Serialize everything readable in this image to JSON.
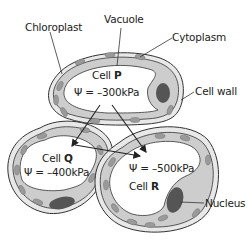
{
  "labels": {
    "chloroplast": "Chloroplast",
    "vacuole": "Vacuole",
    "cytoplasm": "Cytoplasm",
    "cell_wall": "Cell wall",
    "nucleus": "Nucleus"
  },
  "cells": [
    {
      "id": "P",
      "prefix": "Cell",
      "name": "P",
      "potential": "Ψ = –300kPa"
    },
    {
      "id": "Q",
      "prefix": "Cell",
      "name": "Q",
      "potential": "Ψ = –400kPa"
    },
    {
      "id": "R",
      "prefix": "Cell",
      "name": "R",
      "potential": "Ψ = –500kPa"
    }
  ],
  "arrows": [
    {
      "from": "P",
      "to": "Q"
    },
    {
      "from": "P",
      "to": "R"
    },
    {
      "from": "Q",
      "to": "R"
    }
  ],
  "colors": {
    "outline": "#333333",
    "wall_fill": "#e6e6e6",
    "cytoplasm_fill": "#cfcfcf",
    "chloroplast_fill": "#9a9a9a",
    "nucleus_fill": "#555555",
    "vacuole_fill": "#ffffff"
  }
}
